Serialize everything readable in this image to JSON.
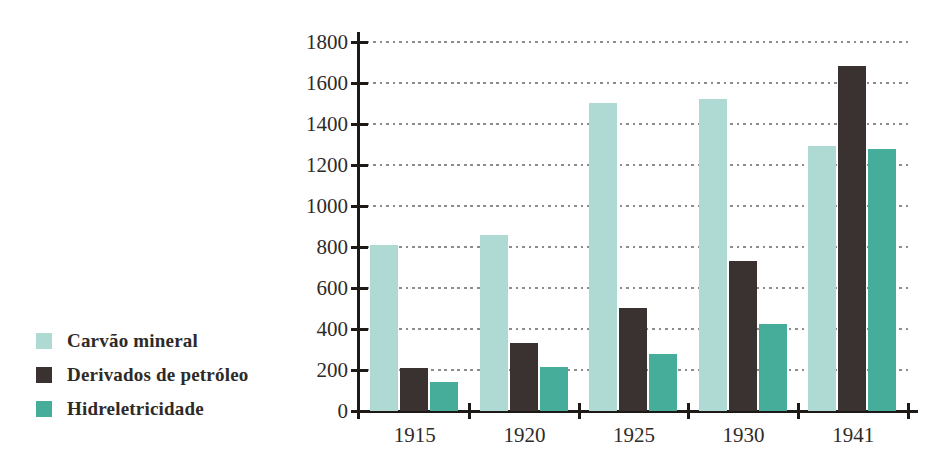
{
  "chart_data": {
    "type": "bar",
    "title": "",
    "xlabel": "",
    "ylabel": "",
    "categories": [
      "1915",
      "1920",
      "1925",
      "1930",
      "1941"
    ],
    "series": [
      {
        "name": "Carvão mineral",
        "color": "#afdad3",
        "values": [
          810,
          860,
          1500,
          1520,
          1295
        ]
      },
      {
        "name": "Derivados de petróleo",
        "color": "#3a3230",
        "values": [
          210,
          330,
          500,
          730,
          1685
        ]
      },
      {
        "name": "Hidreletricidade",
        "color": "#47ad9b",
        "values": [
          140,
          215,
          280,
          425,
          1280
        ]
      }
    ],
    "ylim": [
      0,
      1800
    ],
    "ytick_step": 200,
    "ytick_labels": [
      "0",
      "200",
      "400",
      "600",
      "800",
      "1000",
      "1200",
      "1400",
      "1600",
      "1800"
    ],
    "grid": "horizontal-dotted",
    "legend_position": "left-bottom",
    "axis_color": "#1c1917",
    "grid_color": "#8c8c8c",
    "text_color": "#2e2a28"
  }
}
